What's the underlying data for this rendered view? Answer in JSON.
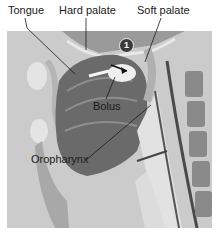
{
  "figure": {
    "labels": {
      "tongue": "Tongue",
      "hard_palate": "Hard palate",
      "soft_palate": "Soft palate",
      "bolus": "Bolus",
      "oropharynx": "Oropharynx"
    },
    "step_badge": "1",
    "colors": {
      "background": "#cfcfcf",
      "tissue_dark": "#5a5a5a",
      "tissue_mid": "#8c8c8c",
      "tissue_light": "#e6e6e6",
      "leader_line": "#1a1a1a"
    }
  }
}
